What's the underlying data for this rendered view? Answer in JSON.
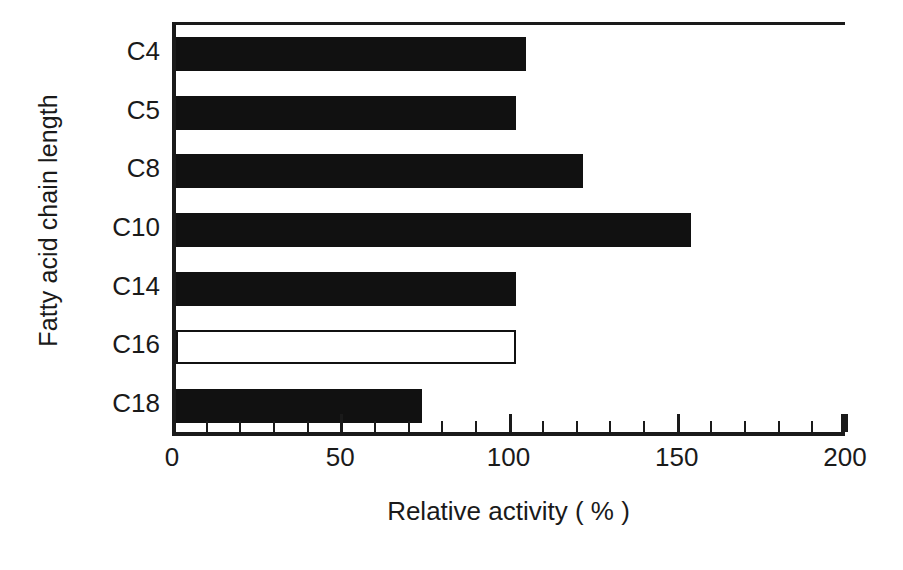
{
  "chart_data": {
    "type": "bar",
    "orientation": "horizontal",
    "title": "",
    "xlabel": "Relative activity ( % )",
    "ylabel": "Fatty acid chain length",
    "categories": [
      "C4",
      "C5",
      "C8",
      "C10",
      "C14",
      "C16",
      "C18"
    ],
    "values": [
      104,
      101,
      121,
      153,
      101,
      101,
      73
    ],
    "series": [
      {
        "name": "Relative activity",
        "values": [
          104,
          101,
          121,
          153,
          101,
          101,
          73
        ]
      }
    ],
    "bar_styles": [
      "filled",
      "filled",
      "filled",
      "filled",
      "filled",
      "open",
      "filled"
    ],
    "highlight_category": "C16",
    "xlim": [
      0,
      200
    ],
    "xticks": [
      0,
      50,
      100,
      150,
      200
    ],
    "xtick_labels": [
      "0",
      "50",
      "100",
      "150",
      "200"
    ],
    "minor_tick_interval": 10,
    "grid": false,
    "legend": "none",
    "colors": {
      "bar_fill": "#111111",
      "bar_open_fill": "#ffffff",
      "bar_stroke": "#111111",
      "axis": "#1a1a1a",
      "background": "#ffffff",
      "text": "#1a1a1a"
    }
  },
  "axes": {
    "y_title": "Fatty acid chain length",
    "x_title": "Relative activity ( % )"
  }
}
